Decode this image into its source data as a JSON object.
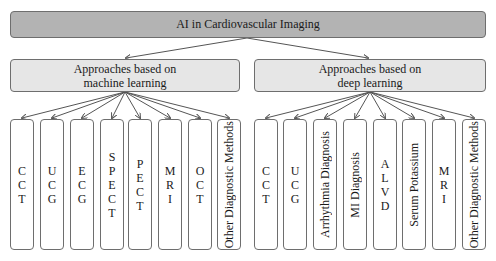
{
  "diagram": {
    "root": {
      "label": "AI in Cardiovascular Imaging"
    },
    "branches": [
      {
        "label_line1": "Approaches based on",
        "label_line2": "machine learning",
        "children": [
          "CCT",
          "UCG",
          "ECG",
          "SPECT",
          "PECT",
          "MRI",
          "OCT",
          "Other Diagnostic Methods"
        ]
      },
      {
        "label_line1": "Approaches based on",
        "label_line2": "deep learning",
        "children": [
          "CCT",
          "UCG",
          "Arrhythmia Diagnosis",
          "MI Diagnosis",
          "ALVD",
          "Serum Potassium",
          "MRI",
          "Other Diagnostic Methods"
        ]
      }
    ],
    "colors": {
      "root_fill": "#b3b3b3",
      "branch_fill": "#e6e6e6",
      "leaf_fill": "#ffffff",
      "border": "#6e6e6e",
      "arrow": "#555555"
    }
  }
}
